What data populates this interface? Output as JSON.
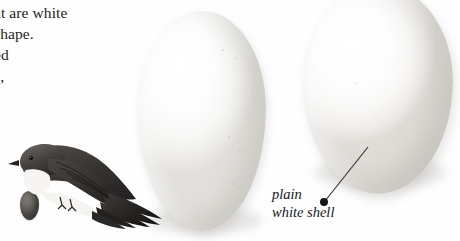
{
  "page": {
    "background_color": "#fefefe",
    "width": 460,
    "height": 241
  },
  "body_text": {
    "lines": [
      "at are white",
      "shape.",
      "ed",
      "s,"
    ],
    "color": "#1d1c1b",
    "note": "text cropped at left page margin"
  },
  "caption": {
    "line1": "plain",
    "line2": "white shell",
    "style": "italic",
    "color": "#17161a",
    "leader_dot": "leader-dot",
    "leader_line": "leader-line"
  },
  "illustration": {
    "bird": {
      "name": "swallow-illustration",
      "description": "perched swallow with long forked tail streamers",
      "plumage_dark": "#2e2b29",
      "plumage_mid": "#6b6763",
      "plumage_light": "#f4f3f1"
    },
    "small_egg": {
      "name": "small-dark-egg",
      "color": "#6d6964"
    },
    "eggs": [
      {
        "name": "egg-left",
        "label": "white egg",
        "fill": "#fdfdfd"
      },
      {
        "name": "egg-right",
        "label": "white egg",
        "fill": "#fdfdfd"
      }
    ]
  }
}
